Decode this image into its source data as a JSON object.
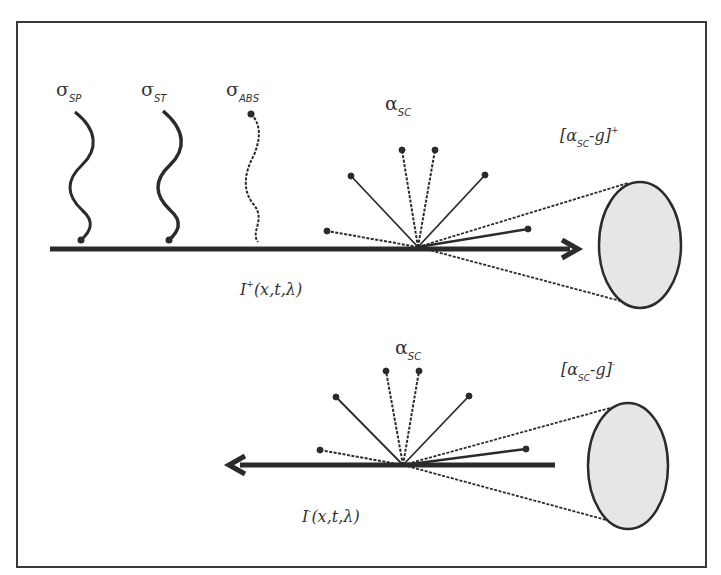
{
  "diagram": {
    "title": "",
    "labels": {
      "sigma_sp": {
        "symbol": "σ",
        "sub": "SP"
      },
      "sigma_st": {
        "symbol": "σ",
        "sub": "ST"
      },
      "sigma_abs": {
        "symbol": "σ",
        "sub": "ABS"
      },
      "alpha_sc_top": {
        "symbol": "α",
        "sub": "SC"
      },
      "alpha_sc_bottom": {
        "symbol": "α",
        "sub": "SC"
      },
      "cone_top": {
        "open": "[α",
        "sub": "SC",
        "mid": "-g]",
        "sup": "+"
      },
      "cone_bottom": {
        "open": "[α",
        "sub": "SC",
        "mid": "-g]",
        "sup": "-"
      },
      "intensity_forward": {
        "main": "I",
        "sup": "+",
        "args": "(x,t,λ)"
      },
      "intensity_backward": {
        "main": "I",
        "sup": "-",
        "args": "(x,t,λ)"
      }
    },
    "nodes": [
      "forward beam I+ (left to right arrow)",
      "backward beam I- (right to left arrow)",
      "spontaneous emission wave σSP",
      "stimulated emission wave σST",
      "absorption wave σABS",
      "scattering fan αSC (top)",
      "scattering fan αSC (bottom)",
      "forward scattering cone [αSC-g]+",
      "backward scattering cone [αSC-g]-"
    ],
    "colors": {
      "stroke": "#2b2b2b",
      "cone_fill": "#e6e6e6",
      "frame": "#3a3a3a"
    }
  }
}
